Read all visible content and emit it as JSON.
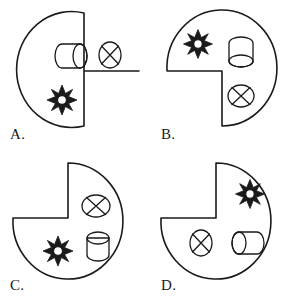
{
  "figure": {
    "kind": "multiple-choice-spatial-reasoning",
    "background_color": "#ffffff",
    "line_color": "#1a1a1a",
    "options": [
      {
        "label": "A.",
        "name": "option-a",
        "notch_quadrant": "bottom-right",
        "icons": [
          {
            "name": "cylinder-horizontal-icon",
            "type": "cylinder",
            "orientation": "horizontal",
            "cap_side": "right",
            "position": "top-left"
          },
          {
            "name": "crossed-ellipse-icon",
            "type": "crossed-ellipse",
            "position": "top-right"
          },
          {
            "name": "sun-icon",
            "type": "sun",
            "position": "bottom-left"
          }
        ]
      },
      {
        "label": "B.",
        "name": "option-b",
        "notch_quadrant": "bottom-left",
        "icons": [
          {
            "name": "sun-icon",
            "type": "sun",
            "position": "top-left"
          },
          {
            "name": "cylinder-vertical-icon",
            "type": "cylinder",
            "orientation": "vertical",
            "cap_side": "bottom",
            "position": "top-right"
          },
          {
            "name": "crossed-ellipse-icon",
            "type": "crossed-ellipse",
            "position": "middle-right"
          }
        ]
      },
      {
        "label": "C.",
        "name": "option-c",
        "notch_quadrant": "top-left",
        "icons": [
          {
            "name": "crossed-ellipse-icon",
            "type": "crossed-ellipse",
            "position": "top-right"
          },
          {
            "name": "cylinder-vertical-icon",
            "type": "cylinder",
            "orientation": "vertical",
            "cap_side": "top",
            "position": "middle-right"
          },
          {
            "name": "sun-icon",
            "type": "sun",
            "position": "bottom-left"
          }
        ]
      },
      {
        "label": "D.",
        "name": "option-d",
        "notch_quadrant": "top-left",
        "icons": [
          {
            "name": "sun-icon",
            "type": "sun",
            "position": "top-right"
          },
          {
            "name": "crossed-ellipse-icon",
            "type": "crossed-ellipse",
            "position": "bottom-left"
          },
          {
            "name": "cylinder-horizontal-icon",
            "type": "cylinder",
            "orientation": "horizontal",
            "cap_side": "left",
            "position": "bottom-right"
          }
        ]
      }
    ]
  }
}
